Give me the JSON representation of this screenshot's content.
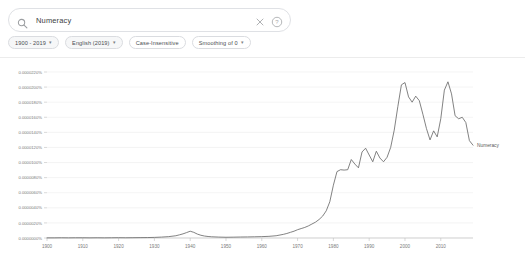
{
  "search": {
    "value": "Numeracy",
    "placeholder": "Search in Google Books",
    "search_icon": "search-icon",
    "clear_icon": "close-icon",
    "help_icon": "help-circle-icon"
  },
  "controls": {
    "chips": [
      {
        "label": "1900 - 2019",
        "has_caret": true,
        "name": "date-range-chip"
      },
      {
        "label": "English (2019)",
        "has_caret": true,
        "name": "corpus-chip"
      },
      {
        "label": "Case-Insensitive",
        "has_caret": false,
        "name": "case-insensitive-chip"
      },
      {
        "label": "Smoothing of 0",
        "has_caret": true,
        "name": "smoothing-chip"
      }
    ]
  },
  "chart_data": {
    "type": "line",
    "title": "",
    "xlabel": "",
    "ylabel": "",
    "series_label": "Numeracy",
    "line_color": "#6b6b6b",
    "grid": true,
    "legend_position": "right-inline",
    "xlim": [
      1900,
      2019
    ],
    "ylim": [
      0.0,
      2.2e-05
    ],
    "xticks": [
      1900,
      1910,
      1920,
      1930,
      1940,
      1950,
      1960,
      1970,
      1980,
      1990,
      2000,
      2010
    ],
    "xticklabels": [
      "1900",
      "1910",
      "1920",
      "1930",
      "1940",
      "1950",
      "1960",
      "1970",
      "1980",
      "1990",
      "2000",
      "2010"
    ],
    "yticks": [
      0.0,
      2e-06,
      4e-06,
      6e-06,
      8e-06,
      1e-05,
      1.2e-05,
      1.4e-05,
      1.6e-05,
      1.8e-05,
      2e-05,
      2.2e-05
    ],
    "yticklabels": [
      "0.0000000%",
      "0.0000020%",
      "0.0000040%",
      "0.0000060%",
      "0.0000080%",
      "0.0000100%",
      "0.0000120%",
      "0.0000140%",
      "0.0000160%",
      "0.0000180%",
      "0.0000200%",
      "0.0000220%"
    ],
    "series": [
      {
        "name": "Numeracy",
        "x": [
          1900,
          1902,
          1904,
          1906,
          1908,
          1910,
          1912,
          1914,
          1916,
          1918,
          1920,
          1922,
          1924,
          1926,
          1928,
          1930,
          1932,
          1934,
          1936,
          1937,
          1938,
          1939,
          1940,
          1941,
          1942,
          1943,
          1944,
          1945,
          1946,
          1948,
          1950,
          1952,
          1954,
          1956,
          1958,
          1960,
          1962,
          1964,
          1966,
          1967,
          1968,
          1969,
          1970,
          1971,
          1972,
          1973,
          1974,
          1975,
          1976,
          1977,
          1978,
          1979,
          1980,
          1981,
          1982,
          1983,
          1984,
          1985,
          1986,
          1987,
          1988,
          1989,
          1990,
          1991,
          1992,
          1993,
          1994,
          1995,
          1996,
          1997,
          1998,
          1999,
          2000,
          2001,
          2002,
          2003,
          2004,
          2005,
          2006,
          2007,
          2008,
          2009,
          2010,
          2011,
          2012,
          2013,
          2014,
          2015,
          2016,
          2017,
          2018,
          2019
        ],
        "values": [
          2e-08,
          2e-08,
          3e-08,
          2e-08,
          3e-08,
          3e-08,
          2e-08,
          3e-08,
          2e-08,
          3e-08,
          4e-08,
          3e-08,
          4e-08,
          5e-08,
          6e-08,
          8e-08,
          1.2e-07,
          1.8e-07,
          3e-07,
          4.2e-07,
          5.5e-07,
          7.2e-07,
          9e-07,
          7.5e-07,
          5.2e-07,
          3.6e-07,
          2.6e-07,
          2e-07,
          1.6e-07,
          1.2e-07,
          1e-07,
          1.1e-07,
          1.3e-07,
          1.4e-07,
          1.6e-07,
          1.8e-07,
          2.2e-07,
          3e-07,
          4.8e-07,
          6e-07,
          7.5e-07,
          9e-07,
          1.1e-06,
          1.25e-06,
          1.4e-06,
          1.6e-06,
          1.85e-06,
          2.1e-06,
          2.45e-06,
          2.9e-06,
          3.6e-06,
          4.8e-06,
          7e-06,
          8.8e-06,
          9.05e-06,
          9e-06,
          9.05e-06,
          1.04e-05,
          9.8e-06,
          9.3e-06,
          1.14e-05,
          1.19e-05,
          1.1e-05,
          1.01e-05,
          1.15e-05,
          1.06e-05,
          1.01e-05,
          1.07e-05,
          1.2e-05,
          1.43e-05,
          1.74e-05,
          2.03e-05,
          2.06e-05,
          1.87e-05,
          1.8e-05,
          1.88e-05,
          1.82e-05,
          1.64e-05,
          1.45e-05,
          1.3e-05,
          1.42e-05,
          1.34e-05,
          1.58e-05,
          1.96e-05,
          2.07e-05,
          1.91e-05,
          1.62e-05,
          1.58e-05,
          1.6e-05,
          1.53e-05,
          1.29e-05,
          1.23e-05
        ]
      }
    ]
  }
}
